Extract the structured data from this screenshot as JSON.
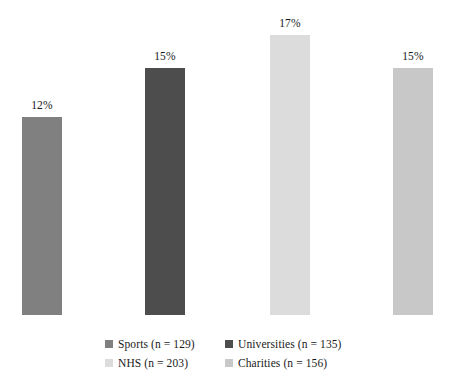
{
  "chart_data": {
    "type": "bar",
    "title": "",
    "subtitle": "",
    "xlabel": "",
    "ylabel": "",
    "grid": false,
    "axes_visible": false,
    "ylim": [
      0,
      18
    ],
    "legend_position": "bottom",
    "categories": [
      "Sports",
      "Universities",
      "NHS",
      "Charities"
    ],
    "values": [
      12,
      15,
      17,
      15
    ],
    "value_labels": [
      "12%",
      "15%",
      "17%",
      "15%"
    ],
    "sample_sizes": [
      129,
      135,
      203,
      156
    ],
    "colors": [
      "#808080",
      "#4d4d4d",
      "#dcdcdc",
      "#c8c8c8"
    ],
    "bars": [
      {
        "category": "Sports",
        "value": 12,
        "value_label": "12%",
        "n": 129,
        "color": "#808080",
        "left_px": 22,
        "width_px": 40,
        "height_px": 198
      },
      {
        "category": "Universities",
        "value": 15,
        "value_label": "15%",
        "n": 135,
        "color": "#4d4d4d",
        "left_px": 145,
        "width_px": 40,
        "height_px": 247
      },
      {
        "category": "NHS",
        "value": 17,
        "value_label": "17%",
        "n": 203,
        "color": "#dcdcdc",
        "left_px": 270,
        "width_px": 40,
        "height_px": 280
      },
      {
        "category": "Charities",
        "value": 15,
        "value_label": "15%",
        "n": 156,
        "color": "#c8c8c8",
        "left_px": 393,
        "width_px": 40,
        "height_px": 247
      }
    ],
    "legend": [
      {
        "label": "Sports (n = 129)",
        "color": "#808080"
      },
      {
        "label": "Universities (n = 135)",
        "color": "#4d4d4d"
      },
      {
        "label": "NHS (n = 203)",
        "color": "#dcdcdc"
      },
      {
        "label": "Charities (n = 156)",
        "color": "#c8c8c8"
      }
    ]
  },
  "background_color": "#ffffff",
  "text_color": "#1a1a1a"
}
